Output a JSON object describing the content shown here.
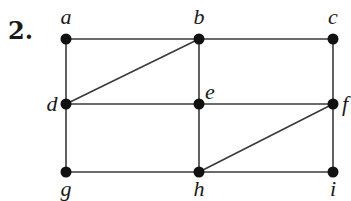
{
  "problem": {
    "number": "2."
  },
  "graph": {
    "nodes": [
      {
        "id": "a",
        "label": "a",
        "x": 66,
        "y": 39,
        "lx": 66,
        "ly": 24,
        "anchor": "middle"
      },
      {
        "id": "b",
        "label": "b",
        "x": 199,
        "y": 39,
        "lx": 199,
        "ly": 24,
        "anchor": "middle"
      },
      {
        "id": "c",
        "label": "c",
        "x": 333,
        "y": 39,
        "lx": 333,
        "ly": 24,
        "anchor": "middle"
      },
      {
        "id": "d",
        "label": "d",
        "x": 66,
        "y": 104,
        "lx": 52,
        "ly": 111,
        "anchor": "middle"
      },
      {
        "id": "e",
        "label": "e",
        "x": 199,
        "y": 104,
        "lx": 210,
        "ly": 99,
        "anchor": "middle"
      },
      {
        "id": "f",
        "label": "f",
        "x": 333,
        "y": 104,
        "lx": 345,
        "ly": 111,
        "anchor": "middle"
      },
      {
        "id": "g",
        "label": "g",
        "x": 66,
        "y": 172,
        "lx": 66,
        "ly": 196,
        "anchor": "middle"
      },
      {
        "id": "h",
        "label": "h",
        "x": 199,
        "y": 172,
        "lx": 199,
        "ly": 196,
        "anchor": "middle"
      },
      {
        "id": "i",
        "label": "i",
        "x": 333,
        "y": 172,
        "lx": 333,
        "ly": 196,
        "anchor": "middle"
      }
    ],
    "edges": [
      [
        "a",
        "b"
      ],
      [
        "b",
        "c"
      ],
      [
        "a",
        "d"
      ],
      [
        "b",
        "d"
      ],
      [
        "b",
        "e"
      ],
      [
        "c",
        "f"
      ],
      [
        "d",
        "e"
      ],
      [
        "e",
        "f"
      ],
      [
        "d",
        "g"
      ],
      [
        "e",
        "h"
      ],
      [
        "f",
        "i"
      ],
      [
        "f",
        "h"
      ],
      [
        "g",
        "h"
      ],
      [
        "h",
        "i"
      ]
    ],
    "colors": {
      "node": "#111111",
      "edge": "#3a3a3a",
      "label": "#1a1a1a"
    }
  }
}
